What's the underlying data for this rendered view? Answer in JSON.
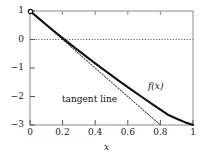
{
  "chart_data": {
    "type": "line",
    "title": "",
    "xlabel": "x",
    "ylabel": "",
    "xlim": [
      0,
      1
    ],
    "ylim": [
      -3,
      1
    ],
    "grid": false,
    "legend": "none",
    "x_ticks": [
      "0",
      "0.2",
      "0.4",
      "0.6",
      "0.8",
      "1"
    ],
    "x_tick_values": [
      0,
      0.2,
      0.4,
      0.6,
      0.8,
      1
    ],
    "y_ticks": [
      "1",
      "0",
      "−1",
      "−2",
      "−3"
    ],
    "y_tick_values": [
      1,
      0,
      -1,
      -2,
      -3
    ],
    "annotations": [
      {
        "name": "f-of-x",
        "text": "f(x)",
        "x": 0.74,
        "y": -1.63
      },
      {
        "name": "tangent-line",
        "text": "tangent line",
        "x": 0.38,
        "y": -2.05
      }
    ],
    "reference_lines": [
      {
        "name": "zero-line",
        "orientation": "horizontal",
        "y": 0,
        "style": "dotted"
      }
    ],
    "markers": [
      {
        "name": "start-point",
        "x": 0,
        "y": 1,
        "style": "open-circle"
      }
    ],
    "series": [
      {
        "name": "f(x)",
        "style": "solid",
        "color": "#111111",
        "x": [
          0,
          0.05,
          0.1,
          0.15,
          0.2,
          0.25,
          0.3,
          0.35,
          0.4,
          0.45,
          0.5,
          0.55,
          0.6,
          0.65,
          0.7,
          0.75,
          0.8,
          0.85,
          0.9,
          0.95,
          1
        ],
        "y": [
          1,
          0.76,
          0.52,
          0.28,
          0.05,
          -0.18,
          -0.4,
          -0.62,
          -0.84,
          -1.05,
          -1.26,
          -1.47,
          -1.67,
          -1.87,
          -2.07,
          -2.27,
          -2.46,
          -2.65,
          -2.78,
          -2.9,
          -3
        ]
      },
      {
        "name": "tangent line",
        "style": "dotted",
        "color": "#555555",
        "x": [
          0,
          0.8
        ],
        "y": [
          1,
          -3
        ]
      }
    ]
  }
}
